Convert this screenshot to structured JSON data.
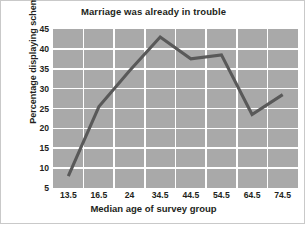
{
  "chart_data": {
    "type": "line",
    "title": "Marriage was already in trouble",
    "xlabel": "Median age of survey group",
    "ylabel": "Percentage displaying schema",
    "categories": [
      "13.5",
      "16.5",
      "24",
      "34.5",
      "44.5",
      "54.5",
      "64.5",
      "74.5"
    ],
    "values": [
      8,
      25.5,
      34.5,
      43,
      37.5,
      38.5,
      23.5,
      28.5
    ],
    "ylim": [
      5,
      45
    ],
    "yticks": [
      5,
      10,
      15,
      20,
      25,
      30,
      35,
      40,
      45
    ],
    "ytick_labels": [
      "5",
      "10",
      "15",
      "20",
      "25",
      "30",
      "35",
      "40",
      "45"
    ],
    "grid": true,
    "legend": "none",
    "series": [
      {
        "name": "Percentage displaying schema",
        "values": [
          8,
          25.5,
          34.5,
          43,
          37.5,
          38.5,
          23.5,
          28.5
        ]
      }
    ],
    "colors": {
      "plot_background": "#a9a9a9",
      "gridline": "#ffffff",
      "line": "#595959",
      "text": "#231f20",
      "figure_background": "#ffffff",
      "border": "#c9c9c9"
    }
  }
}
